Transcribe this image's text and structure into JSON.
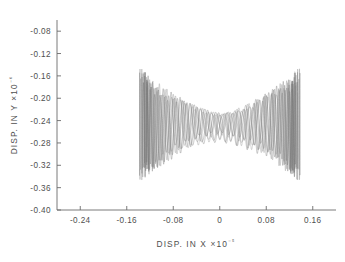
{
  "chart_data": {
    "type": "line",
    "title": "",
    "subtitle": "",
    "xlabel": "DISP. IN X",
    "xlabel_exponent": "×10⁻⁵",
    "ylabel": "DISP. IN Y",
    "ylabel_exponent": "×10⁻⁶",
    "xlim": [
      -0.28,
      0.2
    ],
    "ylim": [
      -0.4,
      -0.06
    ],
    "xticks": [
      -0.24,
      -0.16,
      -0.08,
      0,
      0.08,
      0.16
    ],
    "xtick_labels": [
      "-0.24",
      "-0.16",
      "-0.08",
      "0",
      "0.08",
      "0.16"
    ],
    "yticks": [
      -0.4,
      -0.36,
      -0.32,
      -0.28,
      -0.24,
      -0.2,
      -0.16,
      -0.12,
      -0.08
    ],
    "ytick_labels": [
      "-0.40",
      "-0.36",
      "-0.32",
      "-0.28",
      "-0.24",
      "-0.20",
      "-0.16",
      "-0.12",
      "-0.08"
    ],
    "grid": false,
    "legend": false,
    "legend_position": "none",
    "line_color": "#7d7d7d",
    "axis_color": "#6b6b6b",
    "background_color": "#ffffff",
    "data_x_range": [
      -0.142,
      0.122
    ],
    "data_y_range": [
      -0.345,
      -0.145
    ],
    "envelope_center_y": -0.247,
    "waist_x": 0.0,
    "waist_half_height": 0.022,
    "turning_point_half_height": 0.1,
    "oscillation_cycles": 46,
    "series": [
      {
        "name": "trajectory-1",
        "phase": 0.0,
        "x_amplitude": 0.138,
        "y_center": -0.247,
        "y_envelope_max": 0.098,
        "y_envelope_min": 0.02,
        "fast_cycles": 46,
        "slow_cycles": 1
      },
      {
        "name": "trajectory-2",
        "phase": 0.7,
        "x_amplitude": 0.134,
        "y_center": -0.25,
        "y_envelope_max": 0.092,
        "y_envelope_min": 0.024,
        "fast_cycles": 44,
        "slow_cycles": 1
      },
      {
        "name": "trajectory-3",
        "phase": 1.5,
        "x_amplitude": 0.13,
        "y_center": -0.244,
        "y_envelope_max": 0.088,
        "y_envelope_min": 0.018,
        "fast_cycles": 42,
        "slow_cycles": 1
      },
      {
        "name": "trajectory-4",
        "phase": 2.3,
        "x_amplitude": 0.126,
        "y_center": -0.252,
        "y_envelope_max": 0.082,
        "y_envelope_min": 0.026,
        "fast_cycles": 40,
        "slow_cycles": 1
      }
    ]
  },
  "figure": {
    "name": "displacement-phase-plot"
  }
}
